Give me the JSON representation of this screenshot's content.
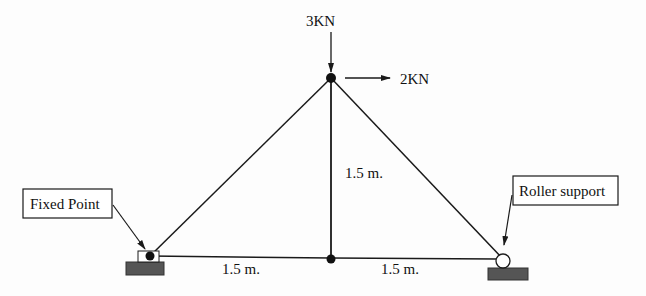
{
  "diagram": {
    "type": "truss",
    "loads": [
      {
        "id": "vertical-load",
        "label": "3KN",
        "direction": "down",
        "node": "apex"
      },
      {
        "id": "horizontal-load",
        "label": "2KN",
        "direction": "right",
        "node": "apex"
      }
    ],
    "dimensions": {
      "left_span": "1.5 m.",
      "right_span": "1.5 m.",
      "height": "1.5 m."
    },
    "supports": {
      "left": {
        "type": "fixed",
        "label": "Fixed Point"
      },
      "right": {
        "type": "roller",
        "label": "Roller support"
      }
    },
    "nodes": [
      "left-support",
      "apex",
      "bottom-middle",
      "right-support"
    ],
    "members": [
      [
        "left-support",
        "apex"
      ],
      [
        "apex",
        "right-support"
      ],
      [
        "apex",
        "bottom-middle"
      ],
      [
        "left-support",
        "bottom-middle"
      ],
      [
        "bottom-middle",
        "right-support"
      ]
    ],
    "colors": {
      "line": "#1a1a1a",
      "support_base": "#555555"
    }
  }
}
